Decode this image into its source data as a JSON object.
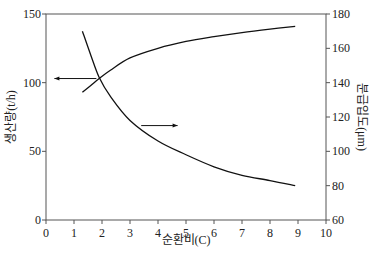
{
  "chart_data": {
    "type": "line",
    "title": "",
    "xlabel": "순환비(C)",
    "ylabel": "생산량(t/h)",
    "y2label": "분급입도(μm)",
    "xlim": [
      0,
      10
    ],
    "ylim": [
      0,
      150
    ],
    "y2lim": [
      60,
      180
    ],
    "xticks": [
      0,
      1,
      2,
      3,
      4,
      5,
      6,
      7,
      8,
      9,
      10
    ],
    "yticks": [
      0,
      50,
      100,
      150
    ],
    "y2ticks": [
      60,
      80,
      100,
      120,
      140,
      160,
      180
    ],
    "grid": false,
    "legend": "none (arrows indicate axis)",
    "series": [
      {
        "name": "생산량(t/h)",
        "axis": "left",
        "x": [
          1.3,
          1.6,
          1.9,
          2.3,
          3,
          4,
          5,
          6,
          7,
          8,
          8.9
        ],
        "y": [
          93,
          98,
          103,
          109,
          118,
          125,
          130,
          133.5,
          136.5,
          139,
          141
        ]
      },
      {
        "name": "분급입도(μm)",
        "axis": "right",
        "x": [
          1.3,
          1.6,
          1.9,
          2.3,
          3,
          4,
          5,
          6,
          7,
          8,
          8.9
        ],
        "y": [
          170,
          156,
          143,
          132,
          118,
          106,
          98,
          91,
          86,
          83,
          80
        ]
      }
    ],
    "annotations": [
      {
        "type": "arrow",
        "direction": "left",
        "from_x": 1.8,
        "at_y_left": 103,
        "to_x": 0.3,
        "meaning": "production curve reads on left axis"
      },
      {
        "type": "arrow",
        "direction": "right",
        "from_x": 3.4,
        "at_y_right": 115,
        "to_x": 4.7,
        "meaning": "classification size curve reads on right axis"
      }
    ]
  }
}
